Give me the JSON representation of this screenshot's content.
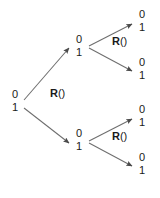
{
  "figure": {
    "background_color": "#ffffff",
    "ink_color": "#1a1a1a",
    "edge_color": "#6e6e6e",
    "width": 160,
    "height": 198
  },
  "diagram": {
    "type": "binary-tree",
    "levels": 3,
    "node_bit_top": "0",
    "node_bit_bottom": "1",
    "operator_name": "R",
    "operator_args": "()",
    "nodes": [
      {
        "id": "root",
        "bit_top": "0",
        "bit_bottom": "1",
        "x": 14,
        "y": 94,
        "level": 0
      },
      {
        "id": "n-0",
        "bit_top": "0",
        "bit_bottom": "1",
        "x": 78,
        "y": 39,
        "level": 1
      },
      {
        "id": "n-1",
        "bit_top": "0",
        "bit_bottom": "1",
        "x": 78,
        "y": 133,
        "level": 1
      },
      {
        "id": "n-00",
        "bit_top": "0",
        "bit_bottom": "1",
        "x": 141,
        "y": 14,
        "level": 2
      },
      {
        "id": "n-01",
        "bit_top": "0",
        "bit_bottom": "1",
        "x": 141,
        "y": 62,
        "level": 2
      },
      {
        "id": "n-10",
        "bit_top": "0",
        "bit_bottom": "1",
        "x": 141,
        "y": 109,
        "level": 2
      },
      {
        "id": "n-11",
        "bit_top": "0",
        "bit_bottom": "1",
        "x": 141,
        "y": 157,
        "level": 2
      }
    ],
    "operator_labels": [
      {
        "id": "op-root",
        "name": "R",
        "args": "()",
        "x": 50,
        "y": 93
      },
      {
        "id": "op-up",
        "name": "R",
        "args": "()",
        "x": 112,
        "y": 41
      },
      {
        "id": "op-down",
        "name": "R",
        "args": "()",
        "x": 112,
        "y": 136
      }
    ],
    "edges": [
      {
        "id": "edge-root-up",
        "from": "root",
        "to": "n-0",
        "x1": 24,
        "y1": 100,
        "x2": 69,
        "y2": 48
      },
      {
        "id": "edge-root-down",
        "from": "root",
        "to": "n-1",
        "x1": 24,
        "y1": 108,
        "x2": 69,
        "y2": 143
      },
      {
        "id": "edge-n0-up",
        "from": "n-0",
        "to": "n-00",
        "x1": 89,
        "y1": 46,
        "x2": 132,
        "y2": 24
      },
      {
        "id": "edge-n0-down",
        "from": "n-0",
        "to": "n-01",
        "x1": 89,
        "y1": 48,
        "x2": 132,
        "y2": 71
      },
      {
        "id": "edge-n1-up",
        "from": "n-1",
        "to": "n-10",
        "x1": 89,
        "y1": 141,
        "x2": 132,
        "y2": 119
      },
      {
        "id": "edge-n1-down",
        "from": "n-1",
        "to": "n-11",
        "x1": 89,
        "y1": 143,
        "x2": 132,
        "y2": 166
      }
    ]
  }
}
